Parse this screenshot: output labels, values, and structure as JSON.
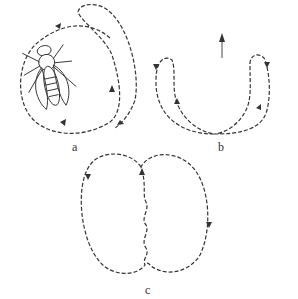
{
  "figure": {
    "panels": [
      {
        "id": "a",
        "label": "a",
        "description": "Insect (fly) with looping dashed flight path around it"
      },
      {
        "id": "b",
        "label": "b",
        "description": "U-shaped dashed paths with arrows; upward arrow above"
      },
      {
        "id": "c",
        "label": "c",
        "description": "Figure-eight style dashed loops with wavy central line"
      }
    ]
  },
  "icons": {
    "insect": "fly-illustration",
    "direction_arrow": "up-arrow"
  },
  "colors": {
    "stroke": "#333333",
    "background": "#ffffff"
  }
}
